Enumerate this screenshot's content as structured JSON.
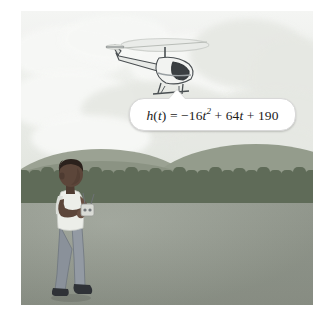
{
  "illustration": {
    "title": "Boy flying a remote-control helicopter in a field",
    "frame": {
      "left": 21,
      "top": 11,
      "width": 292,
      "height": 294
    }
  },
  "callout": {
    "name": "height-function-callout",
    "equation_plain": "h(t) = -16t^2 + 64t + 190",
    "parts": {
      "lhs_fn": "h",
      "lhs_open": "(",
      "lhs_var": "t",
      "lhs_close": ")",
      "equals": "=",
      "term1_sign": "−",
      "term1_coeff": "16",
      "term1_var": "t",
      "term1_exp": "2",
      "plus1": "+",
      "term2_coeff": "64",
      "term2_var": "t",
      "plus2": "+",
      "constant": "190"
    }
  },
  "scene": {
    "sky_label": "sky-with-clouds",
    "hills_label": "rolling-hills",
    "treeline_label": "tree-line",
    "ground_label": "grass-field",
    "helicopter_label": "remote-control-helicopter",
    "boy_label": "boy-with-remote-control"
  },
  "colors": {
    "sky": "#f2f3f0",
    "cloud": "#f7f8f6",
    "cloud_shadow": "#e6e8e3",
    "hill_far": "#9ba293",
    "hill_mid": "#8b9383",
    "treeline": "#5f6b58",
    "ground": "#959b90",
    "callout_bg": "#ffffff",
    "callout_border": "#d8d8d8",
    "text": "#1b1b1b",
    "skin": "#5c463a",
    "hair": "#2b211c",
    "shirt": "#eceee9",
    "jeans": "#878e97",
    "shoes": "#2f3237",
    "helicopter_body": "#f0f1ef",
    "helicopter_outline": "#4a4f52",
    "helicopter_window": "#3b3f42"
  }
}
